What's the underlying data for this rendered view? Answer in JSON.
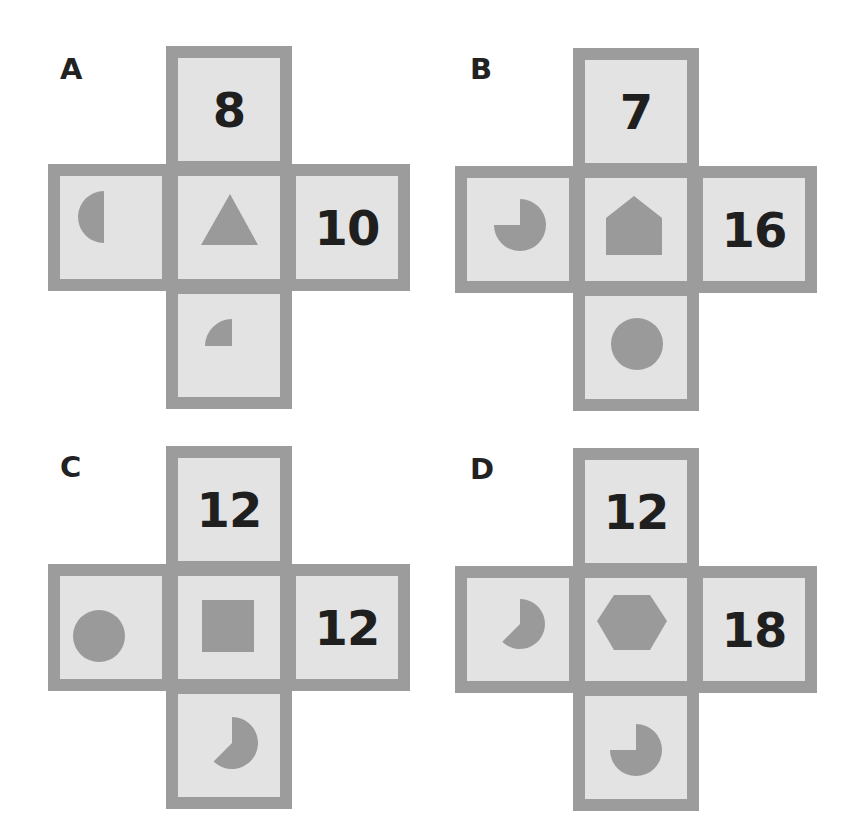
{
  "colors": {
    "background": "#ffffff",
    "tile_fill": "#e3e3e3",
    "tile_border": "#9c9c9c",
    "shape_fill": "#9a9a9a",
    "text": "#1f1f1f"
  },
  "options": [
    {
      "label": "A",
      "top": {
        "type": "number",
        "value": "8"
      },
      "left": {
        "type": "shape",
        "shape": "semicircle-left-icon"
      },
      "center": {
        "type": "shape",
        "shape": "triangle-icon"
      },
      "right": {
        "type": "number",
        "value": "10"
      },
      "bottom": {
        "type": "shape",
        "shape": "quarter-circle-icon"
      }
    },
    {
      "label": "B",
      "top": {
        "type": "number",
        "value": "7"
      },
      "left": {
        "type": "shape",
        "shape": "three-quarter-pie-icon"
      },
      "center": {
        "type": "shape",
        "shape": "pentagon-house-icon"
      },
      "right": {
        "type": "number",
        "value": "16"
      },
      "bottom": {
        "type": "shape",
        "shape": "circle-icon"
      }
    },
    {
      "label": "C",
      "top": {
        "type": "number",
        "value": "12"
      },
      "left": {
        "type": "shape",
        "shape": "circle-icon"
      },
      "center": {
        "type": "shape",
        "shape": "square-icon"
      },
      "right": {
        "type": "number",
        "value": "12"
      },
      "bottom": {
        "type": "shape",
        "shape": "five-eighths-pie-icon"
      }
    },
    {
      "label": "D",
      "top": {
        "type": "number",
        "value": "12"
      },
      "left": {
        "type": "shape",
        "shape": "five-eighths-pie-icon"
      },
      "center": {
        "type": "shape",
        "shape": "hexagon-icon"
      },
      "right": {
        "type": "number",
        "value": "18"
      },
      "bottom": {
        "type": "shape",
        "shape": "three-quarter-pie-icon"
      }
    }
  ]
}
